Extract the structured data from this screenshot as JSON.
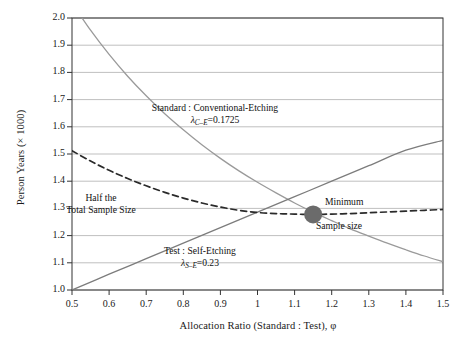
{
  "chart_data": {
    "type": "line",
    "title": "",
    "xlabel": "Allocation Ratio (Standard : Test), φ",
    "ylabel": "Person Years (× 1000)",
    "xlim": [
      0.5,
      1.5
    ],
    "ylim": [
      1.0,
      2.0
    ],
    "xticks": [
      "0.5",
      "0.6",
      "0.7",
      "0.8",
      "0.9",
      "1",
      "1.1",
      "1.2",
      "1.3",
      "1.4",
      "1.5"
    ],
    "xtick_values": [
      0.5,
      0.6,
      0.7,
      0.8,
      0.9,
      1.0,
      1.1,
      1.2,
      1.3,
      1.4,
      1.5
    ],
    "yticks": [
      "1.0",
      "1.1",
      "1.2",
      "1.3",
      "1.4",
      "1.5",
      "1.6",
      "1.7",
      "1.8",
      "1.9",
      "2.0"
    ],
    "ytick_values": [
      1.0,
      1.1,
      1.2,
      1.3,
      1.4,
      1.5,
      1.6,
      1.7,
      1.8,
      1.9,
      2.0
    ],
    "grid": "horizontal",
    "legend_position": "inline-annotations",
    "series": [
      {
        "name": "Standard : Conventional-Etching",
        "style": "solid",
        "color": "#9a9a9a",
        "lambda_label": "λ",
        "lambda_sub": "C–E",
        "lambda_value": "0.1725",
        "x": [
          0.5,
          0.55,
          0.6,
          0.65,
          0.7,
          0.75,
          0.8,
          0.85,
          0.9,
          0.95,
          1.0,
          1.05,
          1.1,
          1.15,
          1.2,
          1.25,
          1.3,
          1.35,
          1.4,
          1.45,
          1.5
        ],
        "y": [
          2.055,
          1.955,
          1.866,
          1.786,
          1.714,
          1.648,
          1.589,
          1.534,
          1.484,
          1.438,
          1.396,
          1.357,
          1.32,
          1.286,
          1.255,
          1.225,
          1.198,
          1.172,
          1.148,
          1.125,
          1.104
        ]
      },
      {
        "name": "Test : Self-Etching",
        "style": "solid",
        "color": "#7c7c7c",
        "lambda_label": "λ",
        "lambda_sub": "S–E",
        "lambda_value": "0.23",
        "x": [
          0.5,
          0.6,
          0.7,
          0.8,
          0.9,
          1.0,
          1.1,
          1.2,
          1.3,
          1.4,
          1.5
        ],
        "y": [
          1.0,
          1.058,
          1.115,
          1.172,
          1.229,
          1.286,
          1.343,
          1.4,
          1.457,
          1.514,
          1.55
        ]
      },
      {
        "name": "Half the Total Sample Size",
        "style": "dashed",
        "color": "#2a2a2a",
        "x": [
          0.5,
          0.55,
          0.6,
          0.65,
          0.7,
          0.75,
          0.8,
          0.85,
          0.9,
          0.95,
          1.0,
          1.05,
          1.1,
          1.15,
          1.2,
          1.25,
          1.3,
          1.35,
          1.4,
          1.45,
          1.5
        ],
        "y": [
          1.512,
          1.474,
          1.44,
          1.41,
          1.383,
          1.359,
          1.338,
          1.32,
          1.305,
          1.293,
          1.285,
          1.281,
          1.279,
          1.278,
          1.279,
          1.281,
          1.284,
          1.287,
          1.29,
          1.293,
          1.296
        ]
      }
    ],
    "markers": [
      {
        "name": "Minimum Sample size",
        "x": 1.15,
        "y": 1.278,
        "color": "#6b6b6b",
        "radius": 9
      }
    ],
    "annotations": [
      {
        "id": "standard-curve-label",
        "line1": "Standard : Conventional-Etching",
        "line2_prefix": "λ",
        "line2_sub": "C–E",
        "line2_suffix": "=0.1725"
      },
      {
        "id": "test-line-label",
        "line1": "Test : Self-Etching",
        "line2_prefix": "λ",
        "line2_sub": "S–E",
        "line2_suffix": "=0.23"
      },
      {
        "id": "half-total-sample-size-label",
        "line1": "Half the",
        "line2": "Total Sample Size"
      },
      {
        "id": "minimum-sample-size-label",
        "line1": "Minimum",
        "line2": "Sample size"
      }
    ]
  },
  "colors": {
    "grid": "#b8b8b8",
    "axis": "#333333",
    "text": "#1a1a1a",
    "standard_curve": "#9a9a9a",
    "test_line": "#7c7c7c",
    "dashed_curve": "#2a2a2a",
    "marker": "#6b6b6b",
    "background": "#ffffff"
  }
}
